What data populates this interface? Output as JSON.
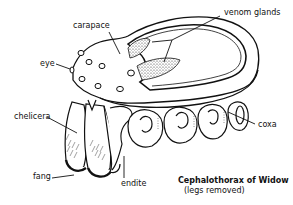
{
  "diagram": {
    "title": "Cephalothorax of Widow",
    "subtitle": "(legs removed)",
    "labels": {
      "carapace": "carapace",
      "venom_glands": "venom glands",
      "eye": "eye",
      "chelicera": "chelicera",
      "fang": "fang",
      "endite": "endite",
      "coxa": "coxa"
    },
    "colors": {
      "ink": "#111111",
      "background": "#ffffff",
      "stipple": "#9a9a9a"
    }
  }
}
